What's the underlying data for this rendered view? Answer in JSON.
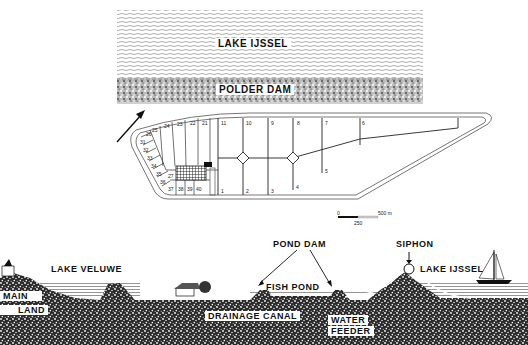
{
  "figure": {
    "type": "diagram"
  },
  "plan_view": {
    "lake_label": "LAKE IJSSEL",
    "dam_label": "POLDER DAM",
    "north_arrow": "arrow-icon",
    "ponds_large": [
      "1",
      "2",
      "3",
      "4",
      "5",
      "6",
      "7",
      "8",
      "9",
      "10",
      "11"
    ],
    "ponds_strip": [
      "21",
      "22",
      "23",
      "24",
      "25",
      "26"
    ],
    "ponds_small": [
      "27",
      "31",
      "32",
      "33",
      "34",
      "35",
      "36",
      "37",
      "38",
      "39",
      "40"
    ],
    "scale_bar": {
      "start": "0",
      "mid": "250",
      "end": "500 m"
    }
  },
  "cross_section": {
    "labels": {
      "lake_veluwe": "LAKE VELUWE",
      "main": "MAIN",
      "land": "LAND",
      "pond_dam": "POND DAM",
      "fish_pond": "FISH POND",
      "drainage_canal": "DRAINAGE CANAL",
      "water": "WATER",
      "feeder": "FEEDER",
      "siphon": "SIPHON",
      "lake_ijssel": "LAKE IJSSEL"
    }
  },
  "colors": {
    "ink": "#111111",
    "paper": "#ffffff",
    "water_line": "#555555",
    "stipple": "#333333"
  }
}
